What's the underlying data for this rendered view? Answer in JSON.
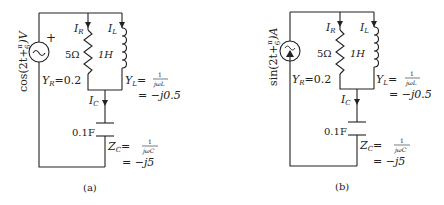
{
  "circuits": [
    {
      "caption": "(a)",
      "source": {
        "type": "voltage",
        "label_fn": "cos",
        "label": "cos(2t + π/6)V",
        "label_expr": "cos(2t+",
        "label_frac_num": "π",
        "label_frac_den": "6",
        "label_unit": ")V",
        "polarity": "+"
      },
      "resistor": {
        "value": "5Ω",
        "current": "I",
        "current_sub": "R",
        "admittance": "Y",
        "admittance_sub": "R",
        "admittance_val": "=0.2"
      },
      "inductor": {
        "value": "1H",
        "current": "I",
        "current_sub": "L",
        "admittance": "Y",
        "admittance_sub": "L",
        "frac_num": "1",
        "frac_den": "jωL",
        "result": "= −j0.5"
      },
      "capacitor": {
        "value": "0.1F",
        "current": "I",
        "current_sub": "C",
        "impedance": "Z",
        "impedance_sub": "C",
        "frac_num": "1",
        "frac_den": "jωC",
        "result": "= −j5"
      }
    },
    {
      "caption": "(b)",
      "source": {
        "type": "current",
        "label_fn": "sin",
        "label": "sin(2t + π/6)A",
        "label_expr": "sin(2t+",
        "label_frac_num": "π",
        "label_frac_den": "6",
        "label_unit": ")A"
      },
      "resistor": {
        "value": "5Ω",
        "current": "I",
        "current_sub": "R",
        "admittance": "Y",
        "admittance_sub": "R",
        "admittance_val": "=0.2"
      },
      "inductor": {
        "value": "1H",
        "current": "I",
        "current_sub": "L",
        "admittance": "Y",
        "admittance_sub": "L",
        "frac_num": "1",
        "frac_den": "jωL",
        "result": "= −j0.5"
      },
      "capacitor": {
        "value": "0.1F",
        "current": "I",
        "current_sub": "C",
        "impedance": "Z",
        "impedance_sub": "C",
        "frac_num": "1",
        "frac_den": "jωC",
        "result": "= −j5"
      }
    }
  ]
}
